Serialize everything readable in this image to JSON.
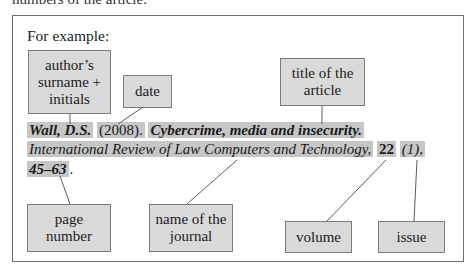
{
  "cutoff_text": "numbers of the article.",
  "example": {
    "heading": "For example:",
    "labels": {
      "author": [
        "author’s",
        "surname +",
        "initials"
      ],
      "date": [
        "date"
      ],
      "title": [
        "title of the",
        "article"
      ],
      "page": [
        "page",
        "number"
      ],
      "journal": [
        "name of the",
        "journal"
      ],
      "volume": [
        "volume"
      ],
      "issue": [
        "issue"
      ]
    },
    "citation": {
      "author": "Wall, D.S.",
      "date": "(2008).",
      "title": "Cybercrime, media and insecurity.",
      "journal": "International Review of Law Computers and Technology,",
      "volume": "22",
      "issue": "(1),",
      "pages": "45–63",
      "end": "."
    }
  },
  "colors": {
    "box_fill": "#d9d9d9",
    "highlight": "#c6c6c6",
    "border": "#7a7a7a",
    "frame_border": "#6e6e6e"
  }
}
